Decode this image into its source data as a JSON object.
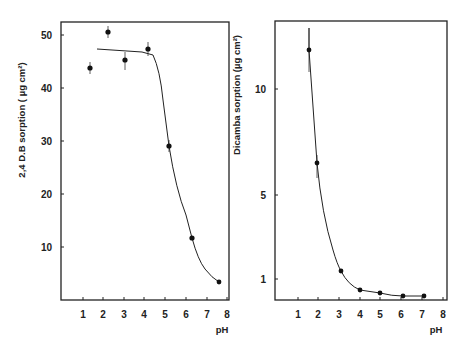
{
  "chart_data": [
    {
      "type": "scatter",
      "title": "",
      "xlabel": "pH",
      "ylabel": "2,4 D.B sorption ( µg cm²)",
      "xlim": [
        0,
        8
      ],
      "ylim": [
        0,
        54
      ],
      "x_ticks": [
        "1",
        "2",
        "3",
        "4",
        "5",
        "6",
        "7",
        "8"
      ],
      "y_ticks": [
        "10",
        "20",
        "30",
        "40",
        "50"
      ],
      "grid": false,
      "series": [
        {
          "name": "2,4 D.B",
          "x": [
            1.4,
            2.2,
            3.0,
            4.2,
            5.2,
            6.3,
            7.6
          ],
          "values": [
            44.3,
            51.0,
            45.5,
            47.5,
            29.0,
            11.5,
            3.5
          ],
          "error_bars": true,
          "fitted_curve": true
        }
      ]
    },
    {
      "type": "scatter",
      "title": "",
      "xlabel": "pH",
      "ylabel": "Dicamba sorption (µg cm²)",
      "xlim": [
        0,
        8
      ],
      "y_ticks": [
        "1",
        "5",
        "10"
      ],
      "x_ticks": [
        "1",
        "2",
        "3",
        "4",
        "5",
        "6",
        "7",
        "8"
      ],
      "grid": false,
      "series": [
        {
          "name": "Dicamba",
          "x": [
            1.7,
            2.0,
            3.1,
            4.0,
            5.0,
            6.1,
            7.1
          ],
          "values": [
            12.5,
            6.5,
            1.2,
            0.6,
            0.5,
            0.4,
            0.4
          ],
          "error_bars": true,
          "fitted_curve": true
        }
      ]
    }
  ],
  "left": {
    "ylabel": "2,4 D.B sorption ( µg cm²)",
    "xlabel": "pH",
    "yticks": [
      {
        "label": "50",
        "y": 35
      },
      {
        "label": "40",
        "y": 88
      },
      {
        "label": "30",
        "y": 141
      },
      {
        "label": "20",
        "y": 194
      },
      {
        "label": "10",
        "y": 247
      }
    ],
    "xticks": [
      {
        "label": "1",
        "x": 83
      },
      {
        "label": "2",
        "x": 103
      },
      {
        "label": "3",
        "x": 124
      },
      {
        "label": "4",
        "x": 144
      },
      {
        "label": "5",
        "x": 165
      },
      {
        "label": "6",
        "x": 186
      },
      {
        "label": "7",
        "x": 207
      },
      {
        "label": "8",
        "x": 227
      }
    ]
  },
  "right": {
    "ylabel": "Dicamba sorption (µg cm²)",
    "xlabel": "pH",
    "yticks": [
      {
        "label": "10",
        "y": 89
      },
      {
        "label": "5",
        "y": 195
      },
      {
        "label": "1",
        "y": 279
      }
    ],
    "xticks": [
      {
        "label": "1",
        "x": 298
      },
      {
        "label": "2",
        "x": 318
      },
      {
        "label": "3",
        "x": 339
      },
      {
        "label": "4",
        "x": 360
      },
      {
        "label": "5",
        "x": 380
      },
      {
        "label": "6",
        "x": 401
      },
      {
        "label": "7",
        "x": 422
      },
      {
        "label": "8",
        "x": 443
      }
    ]
  }
}
